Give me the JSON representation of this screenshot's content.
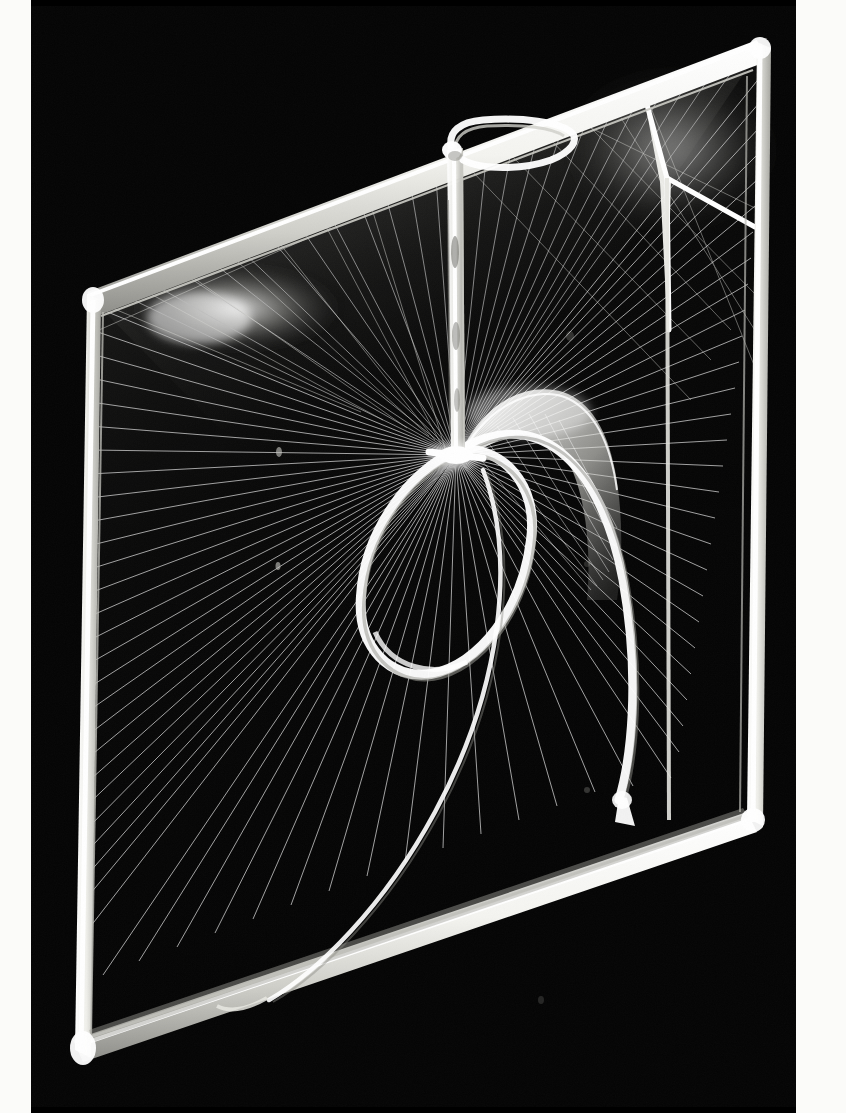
{
  "photo": {
    "medium": "black and white photograph",
    "subject": "constructivist string sculpture of clear acrylic rods with taut nylon threads",
    "background_color": "#000000",
    "border_color": "#fbfbf9",
    "thread_color": "#cfcfcf",
    "acrylic_color": "#f2f2ee",
    "width": 846,
    "height": 1113,
    "orientation": "portrait",
    "border_left_width": 31,
    "border_right_width": 50
  },
  "scene": {
    "frame_label": "tilted quadrilateral acrylic frame",
    "frame_corners": {
      "top_left": "x=62 y=300",
      "top_right": "x=730 y=48",
      "bottom_right": "x=722 y=820",
      "bottom_left": "x=48 y=1055"
    },
    "elements": [
      {
        "name": "outer-frame",
        "kind": "acrylic-bar-quadrilateral"
      },
      {
        "name": "top-hook-loop",
        "kind": "bent-acrylic-hook",
        "position": "top center"
      },
      {
        "name": "vertical-mast",
        "kind": "tapered-acrylic-strip",
        "position": "center, descends from hook to node"
      },
      {
        "name": "central-node",
        "kind": "junction",
        "position": "x=425 y=455"
      },
      {
        "name": "teardrop-loop",
        "kind": "closed-acrylic-loop",
        "position": "center, below node"
      },
      {
        "name": "curved-arm",
        "kind": "swept-acrylic-ribbon",
        "position": "arcs from node right then down to bottom rail"
      },
      {
        "name": "sweep-flare",
        "kind": "translucent-fan-web",
        "position": "right of node"
      },
      {
        "name": "thread-fan",
        "kind": "radiating-nylon-threads",
        "count": 72
      },
      {
        "name": "corner-brace-top-right",
        "kind": "y-shaped-acrylic-brace"
      }
    ],
    "thread_fan_origin": "central-node",
    "thread_count_left": 26,
    "thread_count_right": 30,
    "thread_count_lower": 16
  },
  "palette": {
    "black": "#000000",
    "plate_black": "#050505",
    "white": "#fbfbf9",
    "acrylic_highlight": "#ffffff",
    "acrylic_body": "#e8e8e3",
    "thread": "#bdbdbd",
    "thread_faint": "#8a8a8a",
    "haze": "#6a6a66"
  }
}
